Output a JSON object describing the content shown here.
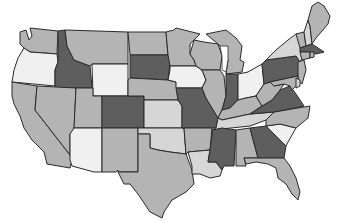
{
  "map": {
    "title": "United States map (grayscale choropleth)",
    "shades": {
      "lightest": "#f0f0f0",
      "light": "#d6d6d6",
      "medium": "#b4b4b4",
      "medium_dark": "#9c9c9c",
      "dark": "#5e5e5e"
    },
    "states": [
      {
        "code": "WA",
        "name": "Washington",
        "shade": "medium"
      },
      {
        "code": "OR",
        "name": "Oregon",
        "shade": "lightest"
      },
      {
        "code": "CA",
        "name": "California",
        "shade": "medium"
      },
      {
        "code": "ID",
        "name": "Idaho",
        "shade": "dark"
      },
      {
        "code": "NV",
        "name": "Nevada",
        "shade": "medium"
      },
      {
        "code": "MT",
        "name": "Montana",
        "shade": "medium"
      },
      {
        "code": "WY",
        "name": "Wyoming",
        "shade": "lightest"
      },
      {
        "code": "UT",
        "name": "Utah",
        "shade": "medium"
      },
      {
        "code": "AZ",
        "name": "Arizona",
        "shade": "lightest"
      },
      {
        "code": "CO",
        "name": "Colorado",
        "shade": "dark"
      },
      {
        "code": "NM",
        "name": "New Mexico",
        "shade": "medium"
      },
      {
        "code": "ND",
        "name": "North Dakota",
        "shade": "medium"
      },
      {
        "code": "SD",
        "name": "South Dakota",
        "shade": "dark"
      },
      {
        "code": "NE",
        "name": "Nebraska",
        "shade": "medium"
      },
      {
        "code": "KS",
        "name": "Kansas",
        "shade": "light"
      },
      {
        "code": "OK",
        "name": "Oklahoma",
        "shade": "light"
      },
      {
        "code": "TX",
        "name": "Texas",
        "shade": "medium"
      },
      {
        "code": "MN",
        "name": "Minnesota",
        "shade": "medium"
      },
      {
        "code": "IA",
        "name": "Iowa",
        "shade": "lightest"
      },
      {
        "code": "MO",
        "name": "Missouri",
        "shade": "dark"
      },
      {
        "code": "AR",
        "name": "Arkansas",
        "shade": "medium"
      },
      {
        "code": "LA",
        "name": "Louisiana",
        "shade": "light"
      },
      {
        "code": "WI",
        "name": "Wisconsin",
        "shade": "medium"
      },
      {
        "code": "IL",
        "name": "Illinois",
        "shade": "medium"
      },
      {
        "code": "MI",
        "name": "Michigan",
        "shade": "medium"
      },
      {
        "code": "IN",
        "name": "Indiana",
        "shade": "dark"
      },
      {
        "code": "OH",
        "name": "Ohio",
        "shade": "lightest"
      },
      {
        "code": "KY",
        "name": "Kentucky",
        "shade": "medium"
      },
      {
        "code": "TN",
        "name": "Tennessee",
        "shade": "light"
      },
      {
        "code": "MS",
        "name": "Mississippi",
        "shade": "dark"
      },
      {
        "code": "AL",
        "name": "Alabama",
        "shade": "medium"
      },
      {
        "code": "GA",
        "name": "Georgia",
        "shade": "dark"
      },
      {
        "code": "FL",
        "name": "Florida",
        "shade": "medium"
      },
      {
        "code": "SC",
        "name": "South Carolina",
        "shade": "lightest"
      },
      {
        "code": "NC",
        "name": "North Carolina",
        "shade": "medium"
      },
      {
        "code": "VA",
        "name": "Virginia",
        "shade": "dark"
      },
      {
        "code": "WV",
        "name": "West Virginia",
        "shade": "medium"
      },
      {
        "code": "PA",
        "name": "Pennsylvania",
        "shade": "dark"
      },
      {
        "code": "NY",
        "name": "New York",
        "shade": "light"
      },
      {
        "code": "NJ",
        "name": "New Jersey",
        "shade": "medium"
      },
      {
        "code": "MD",
        "name": "Maryland",
        "shade": "medium"
      },
      {
        "code": "DE",
        "name": "Delaware",
        "shade": "light"
      },
      {
        "code": "VT",
        "name": "Vermont",
        "shade": "medium"
      },
      {
        "code": "NH",
        "name": "New Hampshire",
        "shade": "light"
      },
      {
        "code": "ME",
        "name": "Maine",
        "shade": "medium"
      },
      {
        "code": "MA",
        "name": "Massachusetts",
        "shade": "dark"
      },
      {
        "code": "CT",
        "name": "Connecticut",
        "shade": "medium"
      },
      {
        "code": "RI",
        "name": "Rhode Island",
        "shade": "medium"
      }
    ]
  }
}
